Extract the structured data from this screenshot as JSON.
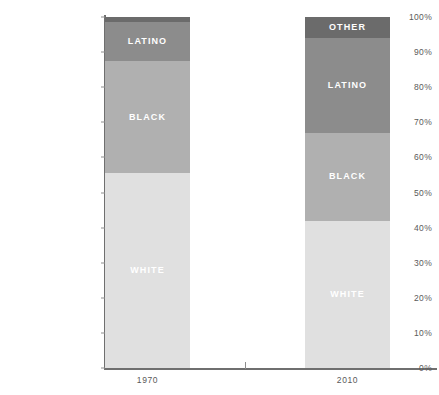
{
  "chart_data": {
    "type": "bar",
    "subtype": "stacked-bar-100-percent",
    "title": "",
    "subtitle": "",
    "xlabel": "",
    "ylabel": "",
    "categories": [
      "1970",
      "2010"
    ],
    "ylim": [
      0,
      100
    ],
    "ytick_labels": [
      "0%",
      "10%",
      "20%",
      "30%",
      "40%",
      "50%",
      "60%",
      "70%",
      "80%",
      "90%",
      "100%"
    ],
    "ytick_values": [
      0,
      10,
      20,
      30,
      40,
      50,
      60,
      70,
      80,
      90,
      100
    ],
    "grid": false,
    "legend": "none (in-bar labels)",
    "series": [
      {
        "name": "WHITE",
        "values": [
          55.5,
          42.0
        ],
        "color": "#e0e0e0"
      },
      {
        "name": "BLACK",
        "values": [
          32.0,
          25.0
        ],
        "color": "#b0b0b0"
      },
      {
        "name": "LATINO",
        "values": [
          11.0,
          27.0
        ],
        "color": "#8c8c8c"
      },
      {
        "name": "OTHER",
        "values": [
          1.5,
          6.0
        ],
        "color": "#6b6b6b"
      }
    ],
    "bars": [
      {
        "category": "1970",
        "segments": [
          {
            "label": "OTHER",
            "value": 1.5,
            "start": 98.5,
            "end": 100.0,
            "color": "#6b6b6b",
            "label_visible": false
          },
          {
            "label": "LATINO",
            "value": 11.0,
            "start": 87.5,
            "end": 98.5,
            "color": "#8c8c8c",
            "label_visible": true
          },
          {
            "label": "BLACK",
            "value": 32.0,
            "start": 55.5,
            "end": 87.5,
            "color": "#b0b0b0",
            "label_visible": true
          },
          {
            "label": "WHITE",
            "value": 55.5,
            "start": 0.0,
            "end": 55.5,
            "color": "#e0e0e0",
            "label_visible": true
          }
        ]
      },
      {
        "category": "2010",
        "segments": [
          {
            "label": "OTHER",
            "value": 6.0,
            "start": 94.0,
            "end": 100.0,
            "color": "#6b6b6b",
            "label_visible": true
          },
          {
            "label": "LATINO",
            "value": 27.0,
            "start": 67.0,
            "end": 94.0,
            "color": "#8c8c8c",
            "label_visible": true
          },
          {
            "label": "BLACK",
            "value": 25.0,
            "start": 42.0,
            "end": 67.0,
            "color": "#b0b0b0",
            "label_visible": true
          },
          {
            "label": "WHITE",
            "value": 42.0,
            "start": 0.0,
            "end": 42.0,
            "color": "#e0e0e0",
            "label_visible": true
          }
        ]
      }
    ]
  },
  "axis": {
    "axis_color": "#6f6f6f",
    "tick_text_color": "#5a5a5a"
  }
}
